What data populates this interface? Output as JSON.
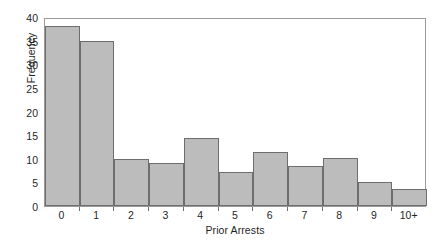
{
  "chart_data": {
    "type": "bar",
    "title": "",
    "subtitle": "",
    "xlabel": "Prior Arrests",
    "ylabel": "Frequency",
    "categories": [
      "0",
      "1",
      "2",
      "3",
      "4",
      "5",
      "6",
      "7",
      "8",
      "9",
      "10+"
    ],
    "values": [
      38,
      35,
      10,
      9,
      14.3,
      7.2,
      11.4,
      8.4,
      10.2,
      5,
      3.6
    ],
    "xlim": [
      0,
      11
    ],
    "ylim": [
      0,
      40
    ],
    "yticks": [
      0,
      5,
      10,
      15,
      20,
      25,
      30,
      35,
      40
    ],
    "ytick_labels": [
      "0",
      "5",
      "10",
      "15",
      "20",
      "25",
      "30",
      "35",
      "40"
    ],
    "grid": false,
    "legend": null,
    "legend_position": "none",
    "bar_fill_color": "#bcbcbc",
    "bar_edge_color": "#6e6e6e",
    "frame_color": "#9a9a9a",
    "background_color": "#ffffff",
    "text_color": "#1f1f1f",
    "annotations": []
  }
}
